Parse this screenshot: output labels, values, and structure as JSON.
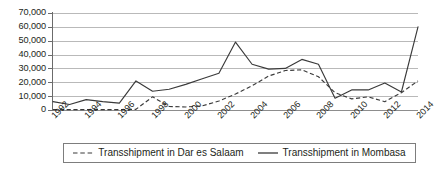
{
  "chart_data": {
    "type": "line",
    "title": "",
    "xlabel": "",
    "ylabel": "",
    "grid": true,
    "legend_position": "bottom",
    "x": [
      1992,
      1993,
      1994,
      1995,
      1996,
      1997,
      1998,
      1999,
      2000,
      2001,
      2002,
      2003,
      2004,
      2005,
      2006,
      2007,
      2008,
      2009,
      2010,
      2011,
      2012,
      2013,
      2014
    ],
    "xlim": [
      1992,
      2014
    ],
    "ylim": [
      0,
      70000
    ],
    "yticks": [
      0,
      10000,
      20000,
      30000,
      40000,
      50000,
      60000,
      70000
    ],
    "ytick_labels": [
      "0",
      "10,000",
      "20,000",
      "30,000",
      "40,000",
      "50,000",
      "60,000",
      "70,000"
    ],
    "xtick_labels": [
      "1992",
      "1994",
      "1996",
      "1998",
      "2000",
      "2002",
      "2004",
      "2006",
      "2008",
      "2010",
      "2012",
      "2014"
    ],
    "xticks": [
      1992,
      1994,
      1996,
      1998,
      2000,
      2002,
      2004,
      2006,
      2008,
      2010,
      2012,
      2014
    ],
    "series": [
      {
        "name": "Transshipment in Dar es Salaam",
        "style": "dashed",
        "color": "#3a3a3a",
        "values": [
          300,
          300,
          300,
          300,
          300,
          500,
          9500,
          2500,
          2200,
          3000,
          6500,
          11500,
          17500,
          24500,
          28500,
          29000,
          24000,
          12500,
          8000,
          9500,
          6000,
          12500,
          21000
        ]
      },
      {
        "name": "Transshipment in Mombasa",
        "style": "solid",
        "color": "#3a3a3a",
        "values": [
          6000,
          4000,
          7500,
          6000,
          5000,
          21000,
          13500,
          15000,
          18500,
          22500,
          26500,
          49000,
          33000,
          29500,
          30000,
          36500,
          33000,
          8500,
          14500,
          14500,
          19500,
          13000,
          60000
        ]
      }
    ]
  },
  "legend": {
    "entries": [
      {
        "label": "Transshipment in Dar es Salaam",
        "style": "dashed"
      },
      {
        "label": "Transshipment in Mombasa",
        "style": "solid"
      }
    ]
  }
}
